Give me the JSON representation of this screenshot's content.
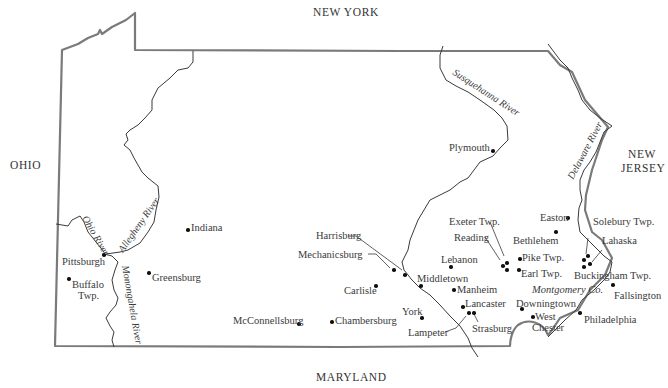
{
  "map": {
    "title": "Pennsylvania",
    "neighbors": {
      "north": "NEW YORK",
      "west": "OHIO",
      "east_line1": "NEW",
      "east_line2": "JERSEY",
      "south": "MARYLAND"
    },
    "rivers": {
      "allegheny": "Allegheny River",
      "ohio": "Ohio River",
      "monongahela": "Monongahela River",
      "susquehanna": "Susquehanna River",
      "delaware": "Delaware River"
    },
    "region_labels": {
      "montgomery": "Montgomery Co."
    },
    "places": {
      "plymouth": "Plymouth",
      "indiana": "Indiana",
      "pittsburgh": "Pittsburgh",
      "buffalo_1": "Buffalo",
      "buffalo_2": "Twp.",
      "greensburg": "Greensburg",
      "mcconnellsburg": "McConnellsburg",
      "chambersburg": "Chambersburg",
      "harrisburg": "Harrisburg",
      "mechanicsburg": "Mechanicsburg",
      "carlisle": "Carlisle",
      "york": "York",
      "middletown": "Middletown",
      "lebanon": "Lebanon",
      "manheim": "Manheim",
      "lancaster": "Lancaster",
      "lampeter": "Lampeter",
      "strasburg": "Strasburg",
      "exeter": "Exeter Twp.",
      "reading": "Reading",
      "bethlehem": "Bethlehem",
      "easton": "Easton",
      "pike": "Pike Twp.",
      "earl": "Earl Twp.",
      "downingtown": "Downingtown",
      "west_chester_1": "West",
      "west_chester_2": "Chester",
      "philadelphia": "Philadelphia",
      "fallsington": "Fallsington",
      "buckingham": "Buckingham Twp.",
      "lahaska": "Lahaska",
      "solebury": "Solebury Twp."
    },
    "colors": {
      "border": "#7a7a7a",
      "river": "#3a3a3a",
      "text": "#3a3a3a"
    }
  }
}
